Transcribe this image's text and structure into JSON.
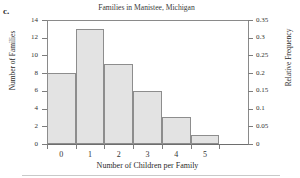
{
  "part_label": "c.",
  "chart_data": {
    "type": "bar",
    "title": "Families in Manistee, Michigan",
    "xlabel": "Number of Children per Family",
    "ylabel": "Number of Families",
    "ylabel_secondary": "Relative Frequency",
    "categories": [
      "0",
      "1",
      "2",
      "3",
      "4",
      "5"
    ],
    "values": [
      8,
      13,
      9,
      6,
      3,
      1
    ],
    "relative_frequencies": [
      0.2,
      0.325,
      0.225,
      0.15,
      0.075,
      0.025
    ],
    "ylim": [
      0,
      14
    ],
    "ylim_secondary": [
      0,
      0.35
    ],
    "yticks": [
      "0",
      "2",
      "4",
      "6",
      "8",
      "10",
      "12",
      "14"
    ],
    "ytick_values": [
      0,
      2,
      4,
      6,
      8,
      10,
      12,
      14
    ],
    "yticks_secondary": [
      "0",
      "0.05",
      "0.1",
      "0.15",
      "0.2",
      "0.25",
      "0.3",
      "0.35"
    ],
    "ytick_values_secondary": [
      0,
      0.05,
      0.1,
      0.15,
      0.2,
      0.25,
      0.3,
      0.35
    ],
    "xtick_values": [
      0,
      1,
      2,
      3,
      4,
      5,
      6
    ],
    "grid": false,
    "legend": null,
    "bar_fill_color": "#e3e3e3",
    "bar_border_color": "#8d8d8d",
    "axis_color": "#7d7d7d",
    "total_families": 40
  }
}
